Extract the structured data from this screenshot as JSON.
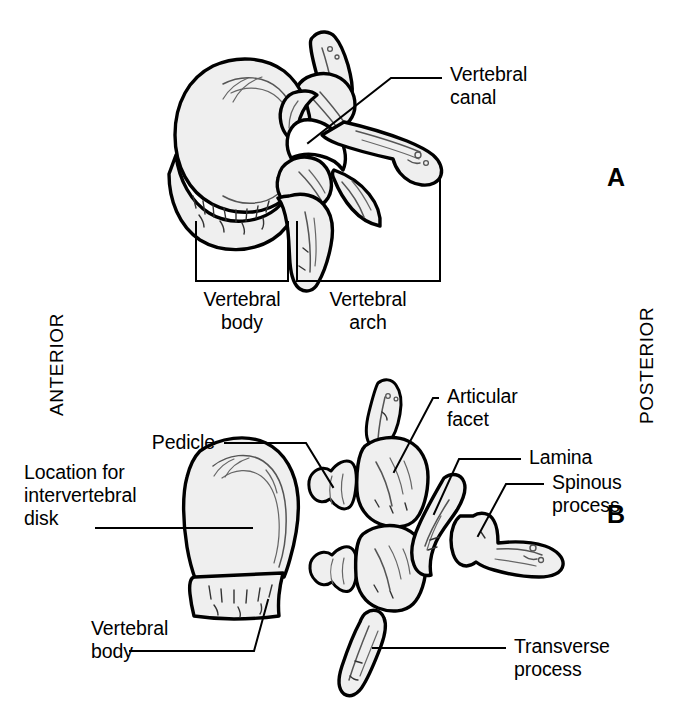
{
  "figure": {
    "background_color": "#ffffff",
    "line_color": "#000000",
    "bone_fill_color": "#efefef",
    "bone_shadow_color": "#d8d8d8"
  },
  "orientation": {
    "left_label": "ANTERIOR",
    "right_label": "POSTERIOR"
  },
  "panels": [
    {
      "id": "A",
      "mark": "A"
    },
    {
      "id": "B",
      "mark": "B"
    }
  ],
  "panel_a": {
    "labels": [
      {
        "name": "vertebral-canal",
        "text": "Vertebral\ncanal"
      }
    ],
    "brackets": [
      {
        "name": "vertebral-body-bracket",
        "text": "Vertebral\nbody"
      },
      {
        "name": "vertebral-arch-bracket",
        "text": "Vertebral\narch"
      }
    ]
  },
  "panel_b": {
    "labels": [
      {
        "name": "pedicle",
        "text": "Pedicle"
      },
      {
        "name": "location-for-intervertebral-disk",
        "text": "Location for\nintervertebral\ndisk"
      },
      {
        "name": "vertebral-body",
        "text": "Vertebral\nbody"
      },
      {
        "name": "articular-facet",
        "text": "Articular\nfacet"
      },
      {
        "name": "lamina",
        "text": "Lamina"
      },
      {
        "name": "spinous-process",
        "text": "Spinous\nprocess"
      },
      {
        "name": "transverse-process",
        "text": "Transverse\nprocess"
      }
    ]
  }
}
